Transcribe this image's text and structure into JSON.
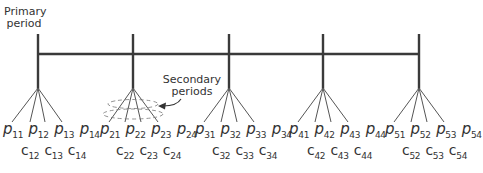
{
  "annotations": {
    "primary": [
      "Primary",
      "period"
    ],
    "secondary": [
      "Secondary",
      "periods"
    ]
  },
  "colors": {
    "line": "#3a3a3a",
    "fan": "#555555",
    "text": "#333333"
  },
  "groups": [
    {
      "id": 1,
      "x": 38,
      "p": [
        {
          "s": "p",
          "i": "11"
        },
        {
          "s": "p",
          "i": "12"
        },
        {
          "s": "p",
          "i": "13"
        },
        {
          "s": "p",
          "i": "14"
        }
      ],
      "c": [
        {
          "s": "c",
          "i": "12"
        },
        {
          "s": "c",
          "i": "13"
        },
        {
          "s": "c",
          "i": "14"
        }
      ]
    },
    {
      "id": 2,
      "x": 133,
      "p": [
        {
          "s": "p",
          "i": "21"
        },
        {
          "s": "p",
          "i": "22"
        },
        {
          "s": "p",
          "i": "23"
        },
        {
          "s": "p",
          "i": "24"
        }
      ],
      "c": [
        {
          "s": "c",
          "i": "22"
        },
        {
          "s": "c",
          "i": "23"
        },
        {
          "s": "c",
          "i": "24"
        }
      ]
    },
    {
      "id": 3,
      "x": 229,
      "p": [
        {
          "s": "p",
          "i": "31"
        },
        {
          "s": "p",
          "i": "32"
        },
        {
          "s": "p",
          "i": "33"
        },
        {
          "s": "p",
          "i": "34"
        }
      ],
      "c": [
        {
          "s": "c",
          "i": "32"
        },
        {
          "s": "c",
          "i": "33"
        },
        {
          "s": "c",
          "i": "34"
        }
      ]
    },
    {
      "id": 4,
      "x": 323,
      "p": [
        {
          "s": "p",
          "i": "41"
        },
        {
          "s": "p",
          "i": "42"
        },
        {
          "s": "p",
          "i": "43"
        },
        {
          "s": "p",
          "i": "44"
        }
      ],
      "c": [
        {
          "s": "c",
          "i": "42"
        },
        {
          "s": "c",
          "i": "43"
        },
        {
          "s": "c",
          "i": "44"
        }
      ]
    },
    {
      "id": 5,
      "x": 419,
      "p": [
        {
          "s": "p",
          "i": "51"
        },
        {
          "s": "p",
          "i": "52"
        },
        {
          "s": "p",
          "i": "53"
        },
        {
          "s": "p",
          "i": "54"
        }
      ],
      "c": [
        {
          "s": "c",
          "i": "52"
        },
        {
          "s": "c",
          "i": "53"
        },
        {
          "s": "c",
          "i": "54"
        }
      ]
    }
  ]
}
